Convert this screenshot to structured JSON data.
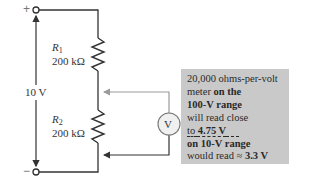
{
  "terminals": {
    "positive": "+",
    "negative": "−"
  },
  "source": {
    "label": "10 V"
  },
  "resistors": [
    {
      "name": "R",
      "subscript": "1",
      "value": "200 kΩ"
    },
    {
      "name": "R",
      "subscript": "2",
      "value": "200 kΩ"
    }
  ],
  "meter": {
    "symbol": "V"
  },
  "note": {
    "line1": "20,000 ohms-per-volt",
    "line2_plain": "meter ",
    "line2_bold": "on the",
    "line3_bold": "100-V range",
    "line4": "will read close",
    "line5_plain": "to ",
    "line5_bold": "4.75 V",
    "line6_bold": "on 10-V range",
    "line7_plain": "would read ≈ ",
    "line7_bold": "3.3 V"
  },
  "colors": {
    "wire": "#333333",
    "probe_wire": "#9a9a9a",
    "note_background": "#c9c9c9",
    "meter_fill": "#f0f0f0"
  }
}
